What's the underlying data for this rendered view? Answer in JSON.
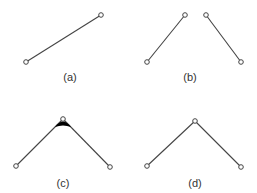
{
  "diagram": {
    "colors": {
      "edge": "#444444",
      "node_fill": "#ffffff",
      "node_stroke": "#444444",
      "wedge": "#000000",
      "label": "#333333",
      "background": "#ffffff"
    },
    "panels": [
      {
        "id": "a",
        "label": "(a)",
        "label_pos": [
          70,
          72
        ],
        "nodes": [
          [
            26,
            62
          ],
          [
            101,
            15
          ]
        ],
        "edges": [
          [
            0,
            1
          ]
        ],
        "wedge": false
      },
      {
        "id": "b",
        "label": "(b)",
        "label_pos": [
          190,
          72
        ],
        "nodes": [
          [
            147,
            62
          ],
          [
            185,
            15
          ],
          [
            206,
            15
          ],
          [
            241,
            62
          ]
        ],
        "edges": [
          [
            0,
            1
          ],
          [
            2,
            3
          ]
        ],
        "wedge": false
      },
      {
        "id": "c",
        "label": "(c)",
        "label_pos": [
          63,
          178
        ],
        "nodes": [
          [
            16,
            166
          ],
          [
            63,
            119
          ],
          [
            110,
            167
          ]
        ],
        "edges": [
          [
            0,
            1
          ],
          [
            1,
            2
          ]
        ],
        "wedge": true
      },
      {
        "id": "d",
        "label": "(d)",
        "label_pos": [
          195,
          178
        ],
        "nodes": [
          [
            147,
            166
          ],
          [
            195,
            121
          ],
          [
            241,
            167
          ]
        ],
        "edges": [
          [
            0,
            1
          ],
          [
            1,
            2
          ]
        ],
        "wedge": false
      }
    ]
  }
}
